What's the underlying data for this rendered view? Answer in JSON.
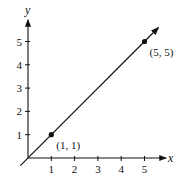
{
  "chart_data": {
    "type": "line",
    "title": "",
    "xlabel": "x",
    "ylabel": "y",
    "xlim": [
      0,
      5.5
    ],
    "ylim": [
      0,
      5.5
    ],
    "x_ticks": [
      1,
      2,
      3,
      4,
      5
    ],
    "y_ticks": [
      1,
      2,
      3,
      4,
      5
    ],
    "x_tick_labels": [
      "1",
      "2",
      "3",
      "4",
      "5"
    ],
    "y_tick_labels": [
      "1",
      "2",
      "3",
      "4",
      "5"
    ],
    "grid": false,
    "series": [
      {
        "name": "y = x",
        "line": {
          "from": [
            -0.2,
            -0.2
          ],
          "to": [
            5.6,
            5.6
          ],
          "arrow_end": true
        },
        "points": [
          {
            "x": 1,
            "y": 1,
            "label": "(1, 1)"
          },
          {
            "x": 5,
            "y": 5,
            "label": "(5, 5)"
          }
        ]
      }
    ],
    "colors": {
      "ink": "#111111"
    }
  }
}
